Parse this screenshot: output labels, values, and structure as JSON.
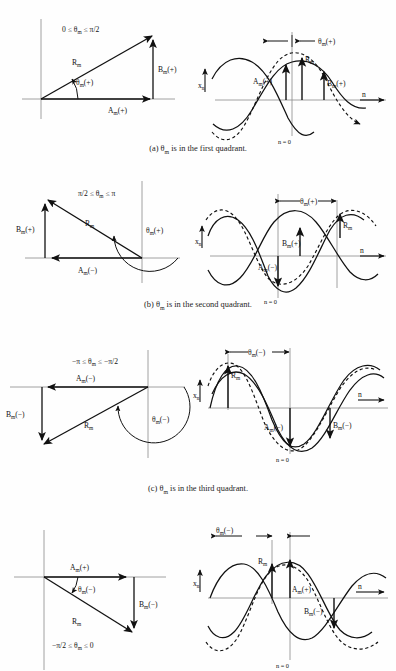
{
  "figure": {
    "header_text": "",
    "axis_labels": {
      "x_axis": "n",
      "y_axis": "x",
      "y_sub": "n",
      "origin": "n = 0"
    },
    "symbols": {
      "R": "R",
      "A": "A",
      "B": "B",
      "theta": "θ",
      "sub_m": "m",
      "plus": "(+)",
      "minus": "(−)",
      "arrow": "→"
    }
  },
  "panels": [
    {
      "id": "a",
      "caption": "(a)  θm  is in the first quadrant.",
      "caption_parts": {
        "tag": "(a)",
        "sym": "θ",
        "sub": "m",
        "rest": "is in the first quadrant."
      },
      "range_label": "0 ≤ θm ≤ π/2",
      "range_parts": {
        "lo": "0 ≤ ",
        "sym": "θ",
        "sub": "m",
        "hi": " ≤ π/2"
      },
      "vector": {
        "R_label": "Rm",
        "A_label": "Am(+)",
        "B_label": "Bm(+)",
        "theta_label": "θm(+)",
        "A_sign": "(+)",
        "B_sign": "(+)",
        "theta_sign": "(+)",
        "quadrant": 1
      },
      "wave": {
        "theta_bracket": "θm(+)",
        "R_label": "Rm",
        "A_label": "Am(+)",
        "B_label": "Bm(+)",
        "origin_label": "n = 0",
        "x_axis_label": "n →",
        "y_axis_label": "xn",
        "phase_shift_sign": "positive"
      }
    },
    {
      "id": "b",
      "caption": "(b)  θm  is in the second quadrant.",
      "caption_parts": {
        "tag": "(b)",
        "sym": "θ",
        "sub": "m",
        "rest": "is in the second quadrant."
      },
      "range_label": "π/2 ≤ θm ≤ π",
      "range_parts": {
        "lo": "π/2 ≤ ",
        "sym": "θ",
        "sub": "m",
        "hi": " ≤ π"
      },
      "vector": {
        "R_label": "Rm",
        "A_label": "Am(−)",
        "B_label": "Bm(+)",
        "theta_label": "θm(+)",
        "A_sign": "(−)",
        "B_sign": "(+)",
        "theta_sign": "(+)",
        "quadrant": 2
      },
      "wave": {
        "theta_bracket": "θm(+)",
        "R_label": "Rm",
        "A_label": "Am(−)",
        "B_label": "Bm(+)",
        "origin_label": "n = 0",
        "x_axis_label": "n →",
        "y_axis_label": "xn",
        "phase_shift_sign": "positive"
      }
    },
    {
      "id": "c",
      "caption": "(c)  θm  is in the third quadrant.",
      "caption_parts": {
        "tag": "(c)",
        "sym": "θ",
        "sub": "m",
        "rest": "is in the third quadrant."
      },
      "range_label": "−π ≤ θm ≤ −π/2",
      "range_parts": {
        "lo": "−π ≤ ",
        "sym": "θ",
        "sub": "m",
        "hi": " ≤ −π/2"
      },
      "vector": {
        "R_label": "Rm",
        "A_label": "Am(−)",
        "B_label": "Bm(−)",
        "theta_label": "θm(−)",
        "A_sign": "(−)",
        "B_sign": "(−)",
        "theta_sign": "(−)",
        "quadrant": 3
      },
      "wave": {
        "theta_bracket": "θm(−)",
        "R_label": "Rm",
        "A_label": "Am(−)",
        "B_label": "Bm(−)",
        "origin_label": "n = 0",
        "x_axis_label": "n →",
        "y_axis_label": "xn",
        "phase_shift_sign": "negative"
      }
    },
    {
      "id": "d",
      "caption": "",
      "caption_parts": {
        "tag": "",
        "sym": "",
        "sub": "",
        "rest": ""
      },
      "range_label": "−π/2 ≤ θm ≤ 0",
      "range_parts": {
        "lo": "−π/2 ≤ ",
        "sym": "θ",
        "sub": "m",
        "hi": " ≤ 0"
      },
      "vector": {
        "R_label": "Rm",
        "A_label": "Am(+)",
        "B_label": "Bm(−)",
        "theta_label": "θm(−)",
        "A_sign": "(+)",
        "B_sign": "(−)",
        "theta_sign": "(−)",
        "quadrant": 4
      },
      "wave": {
        "theta_bracket": "θm(−)",
        "R_label": "Rm",
        "A_label": "Am(+)",
        "B_label": "Bm(−)",
        "origin_label": "n = 0",
        "x_axis_label": "n →",
        "y_axis_label": "xn",
        "phase_shift_sign": "negative"
      }
    }
  ],
  "colors": {
    "ink": "#111111",
    "axis": "#6f6f6f",
    "paper": "#fefefe"
  }
}
